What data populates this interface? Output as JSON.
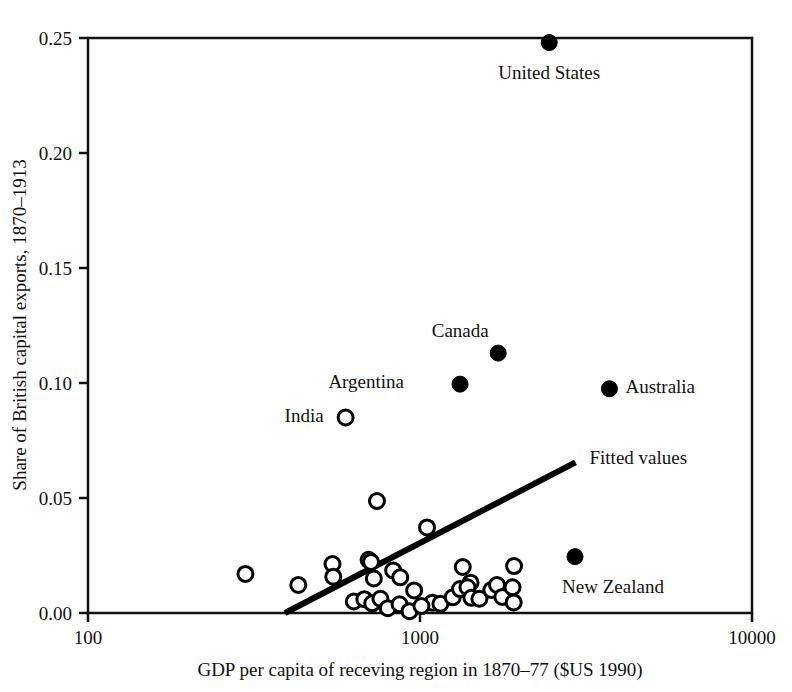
{
  "chart_data": {
    "type": "scatter",
    "title": "",
    "xlabel": "GDP per capita of receving region in 1870–77 ($US 1990)",
    "ylabel": "Share of British capital exports, 1870–1913",
    "xscale": "log",
    "yscale": "linear",
    "xlim": [
      100,
      10000
    ],
    "ylim": [
      0.0,
      0.25
    ],
    "xticks": [
      "100",
      "1000",
      "10000"
    ],
    "xtick_values": [
      100,
      1000,
      10000
    ],
    "yticks": [
      "0.00",
      "0.05",
      "0.10",
      "0.15",
      "0.20",
      "0.25"
    ],
    "ytick_values": [
      0.0,
      0.05,
      0.1,
      0.15,
      0.2,
      0.25
    ],
    "grid": false,
    "legend": "none",
    "frame": "box",
    "series": [
      {
        "name": "Labelled regions (settler economies)",
        "marker": "filled-circle",
        "color": "#000000",
        "points": [
          {
            "label": "United States",
            "x": 2450,
            "y": 0.248,
            "label_dx": 0,
            "label_dy": 30,
            "label_anchor": "middle"
          },
          {
            "label": "Canada",
            "x": 1720,
            "y": 0.113,
            "label_dx": -38,
            "label_dy": -22,
            "label_anchor": "middle"
          },
          {
            "label": "Argentina",
            "x": 1320,
            "y": 0.0995,
            "label_dx": -56,
            "label_dy": -2,
            "label_anchor": "end"
          },
          {
            "label": "Australia",
            "x": 3720,
            "y": 0.0975,
            "label_dx": 16,
            "label_dy": -2,
            "label_anchor": "start"
          },
          {
            "label": "New Zealand",
            "x": 2930,
            "y": 0.0245,
            "label_dx": 38,
            "label_dy": 30,
            "label_anchor": "middle"
          }
        ]
      },
      {
        "name": "Other receiving regions",
        "marker": "open-circle",
        "color": "#000000",
        "points": [
          {
            "label": "India",
            "x": 597,
            "y": 0.085,
            "label_dx": -22,
            "label_dy": -2,
            "label_anchor": "end"
          },
          {
            "label": "",
            "x": 742,
            "y": 0.0487
          },
          {
            "label": "",
            "x": 1050,
            "y": 0.0372
          },
          {
            "label": "",
            "x": 298,
            "y": 0.017
          },
          {
            "label": "",
            "x": 430,
            "y": 0.0122
          },
          {
            "label": "",
            "x": 545,
            "y": 0.0213
          },
          {
            "label": "",
            "x": 548,
            "y": 0.0158
          },
          {
            "label": "",
            "x": 700,
            "y": 0.0231
          },
          {
            "label": "",
            "x": 712,
            "y": 0.0222
          },
          {
            "label": "",
            "x": 726,
            "y": 0.015
          },
          {
            "label": "",
            "x": 830,
            "y": 0.0185
          },
          {
            "label": "",
            "x": 872,
            "y": 0.0155
          },
          {
            "label": "",
            "x": 1345,
            "y": 0.02
          },
          {
            "label": "",
            "x": 1420,
            "y": 0.0132
          },
          {
            "label": "",
            "x": 1920,
            "y": 0.0204
          },
          {
            "label": "",
            "x": 632,
            "y": 0.005
          },
          {
            "label": "",
            "x": 680,
            "y": 0.006
          },
          {
            "label": "",
            "x": 718,
            "y": 0.0042
          },
          {
            "label": "",
            "x": 760,
            "y": 0.0062
          },
          {
            "label": "",
            "x": 800,
            "y": 0.0021
          },
          {
            "label": "",
            "x": 868,
            "y": 0.0038
          },
          {
            "label": "",
            "x": 930,
            "y": 0.0008
          },
          {
            "label": "",
            "x": 1090,
            "y": 0.0045
          },
          {
            "label": "",
            "x": 1152,
            "y": 0.004
          },
          {
            "label": "",
            "x": 1255,
            "y": 0.0068
          },
          {
            "label": "",
            "x": 1320,
            "y": 0.0104
          },
          {
            "label": "",
            "x": 1390,
            "y": 0.0112
          },
          {
            "label": "",
            "x": 1428,
            "y": 0.0066
          },
          {
            "label": "",
            "x": 1510,
            "y": 0.0062
          },
          {
            "label": "",
            "x": 1640,
            "y": 0.01
          },
          {
            "label": "",
            "x": 1706,
            "y": 0.0122
          },
          {
            "label": "",
            "x": 1770,
            "y": 0.007
          },
          {
            "label": "",
            "x": 1900,
            "y": 0.0112
          },
          {
            "label": "",
            "x": 1915,
            "y": 0.0046
          },
          {
            "label": "",
            "x": 960,
            "y": 0.0098
          },
          {
            "label": "",
            "x": 1010,
            "y": 0.003
          }
        ]
      }
    ],
    "fit_line": {
      "label": "Fitted values",
      "style": "solid",
      "width": 6,
      "color": "#000000",
      "x0": 392,
      "y0": 0.0,
      "x1": 2940,
      "y1": 0.0655,
      "label_dx": 14,
      "label_dy": 2
    }
  }
}
